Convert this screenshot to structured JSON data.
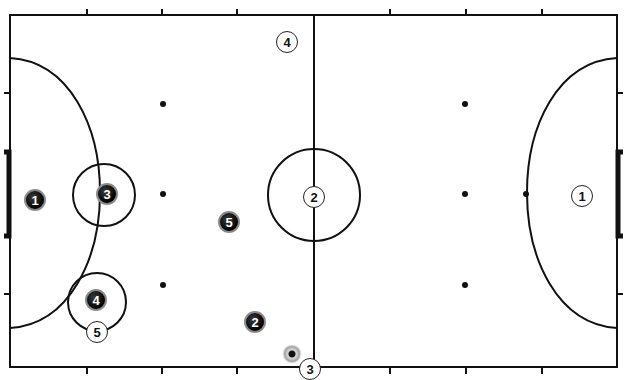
{
  "diagram": {
    "type": "futsal-court-formation",
    "colors": {
      "lines": "#111111",
      "dark_team": "#111111",
      "light_team": "#ffffff",
      "background": "#ffffff"
    },
    "dark_team": [
      {
        "number": "1",
        "x": 35,
        "y": 200
      },
      {
        "number": "3",
        "x": 107,
        "y": 194
      },
      {
        "number": "5",
        "x": 229,
        "y": 222
      },
      {
        "number": "4",
        "x": 96,
        "y": 300
      },
      {
        "number": "2",
        "x": 255,
        "y": 322
      }
    ],
    "light_team": [
      {
        "number": "4",
        "x": 287,
        "y": 42
      },
      {
        "number": "2",
        "x": 314,
        "y": 197
      },
      {
        "number": "1",
        "x": 582,
        "y": 196
      },
      {
        "number": "5",
        "x": 97,
        "y": 332
      },
      {
        "number": "3",
        "x": 310,
        "y": 369
      }
    ],
    "ball": {
      "x": 292,
      "y": 354
    }
  }
}
